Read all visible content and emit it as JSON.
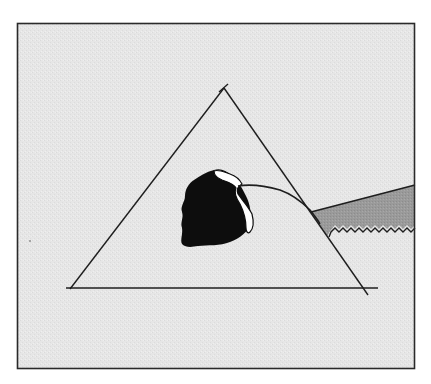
{
  "figure": {
    "colors": {
      "page_background": "#ffffff",
      "panel_background": "#e6e6e6",
      "frame_stroke": "#2a2a2a",
      "line_stroke": "#1e1e1e",
      "blob_fill": "#0d0d0d",
      "highlight_fill": "#ffffff",
      "band_fill": "#9a9a9a"
    },
    "frame": {
      "x": 17,
      "y": 23,
      "width": 398,
      "height": 346
    },
    "triangle": {
      "apex": [
        224,
        88
      ],
      "bottom_left": [
        70,
        289
      ],
      "bottom_right": [
        368,
        293
      ],
      "base_line": {
        "x1": 66,
        "y1": 288,
        "x2": 378,
        "y2": 288
      }
    },
    "blob": {
      "center": [
        214,
        210
      ]
    },
    "band": {
      "left_tip": [
        311,
        212
      ],
      "top_right": [
        415,
        185
      ],
      "bottom_right": [
        415,
        225
      ]
    }
  }
}
